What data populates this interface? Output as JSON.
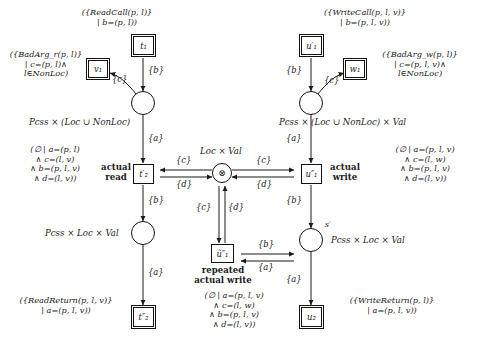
{
  "diagram": {
    "transitions": [
      {
        "id": "t1",
        "label": "t₁",
        "double": true
      },
      {
        "id": "v1",
        "label": "v₁",
        "double": true
      },
      {
        "id": "t2p",
        "label": "t′₂",
        "double": false
      },
      {
        "id": "t2pp",
        "label": "t″₂",
        "double": true
      },
      {
        "id": "u1p",
        "label": "u′₁",
        "double": true
      },
      {
        "id": "w1",
        "label": "w₁",
        "double": true
      },
      {
        "id": "u1pp",
        "label": "u″₁",
        "double": false
      },
      {
        "id": "u1tilde",
        "label": "ũ″₁",
        "double": false
      },
      {
        "id": "u2",
        "label": "u₂",
        "double": true
      }
    ],
    "places": [
      {
        "id": "p_read_in",
        "type_label": "Pcss × (Loc ∪ NonLoc)"
      },
      {
        "id": "p_read_out",
        "type_label": "Pcss × Loc × Val"
      },
      {
        "id": "p_write_in",
        "type_label": "Pcss × (Loc ∪ NonLoc) × Val"
      },
      {
        "id": "p_write_out",
        "type_label": "Pcss × Loc × Val",
        "marker": "s′"
      },
      {
        "id": "p_store",
        "type_label": "Loc × Val",
        "symbol": "⊗"
      }
    ],
    "labels": {
      "read_call": "({ReadCall(p, l)}\n| b=(p, l))",
      "bad_arg_r": "({BadArg_r(p, l)}\n| c=(p, l)∧\nl∈NonLoc)",
      "read_guard": "(∅ | a=(p, l)\n∧ c=(l, v)\n∧ b=(p, l, v)\n∧ d=(l, v))",
      "read_return": "({ReadReturn(p, l, v)}\n| a=(p, l, v))",
      "write_call": "({WriteCall(p, l, v)}\n| b=(p, l, v))",
      "bad_arg_w": "({BadArg_w(p, l)}\n| c=(p, l, v)∧\nl∈NonLoc)",
      "write_guard": "(∅ | a=(p, l, v)\n∧ c=(l, w)\n∧ b=(p, l, v)\n∧ d=(l, v))",
      "repeated_guard": "(∅ | a=(p, l, v)\n∧ c=(l, w)\n∧ b=(p, l, v)\n∧ d=(l, v))",
      "write_return": "({WriteReturn(p, l)}\n| a=(p, l, v))",
      "actual_read": "actual\nread",
      "actual_write": "actual\nwrite",
      "repeated_actual_write": "repeated\nactual write",
      "store_type": "Loc × Val",
      "read_in_type": "Pcss × (Loc ∪ NonLoc)",
      "read_out_type": "Pcss × Loc × Val",
      "write_in_type": "Pcss × (Loc ∪ NonLoc) × Val",
      "write_out_type": "Pcss × Loc × Val",
      "place_marker": "s′"
    },
    "arcs": [
      {
        "from": "t1",
        "to": "p_read_in",
        "label": "{b}"
      },
      {
        "from": "p_read_in",
        "to": "v1",
        "label": "{c}"
      },
      {
        "from": "p_read_in",
        "to": "t2p",
        "label": "{a}"
      },
      {
        "from": "p_store",
        "to": "t2p",
        "label": "{c}"
      },
      {
        "from": "t2p",
        "to": "p_store",
        "label": "{d}"
      },
      {
        "from": "t2p",
        "to": "p_read_out",
        "label": "{b}"
      },
      {
        "from": "p_read_out",
        "to": "t2pp",
        "label": "{a}"
      },
      {
        "from": "u1p",
        "to": "p_write_in",
        "label": "{b}"
      },
      {
        "from": "p_write_in",
        "to": "w1",
        "label": "{c}"
      },
      {
        "from": "p_write_in",
        "to": "u1pp",
        "label": "{a}"
      },
      {
        "from": "p_store",
        "to": "u1pp",
        "label": "{c}"
      },
      {
        "from": "u1pp",
        "to": "p_store",
        "label": "{d}"
      },
      {
        "from": "u1pp",
        "to": "p_write_out",
        "label": "{b}"
      },
      {
        "from": "p_store",
        "to": "u1tilde",
        "label": "{c}"
      },
      {
        "from": "u1tilde",
        "to": "p_store",
        "label": "{d}"
      },
      {
        "from": "u1tilde",
        "to": "p_write_out",
        "label": "{b}"
      },
      {
        "from": "p_write_out",
        "to": "u1tilde",
        "label": "{a}"
      },
      {
        "from": "p_write_out",
        "to": "u2",
        "label": "{a}"
      }
    ]
  },
  "colors": {
    "ink": "#1a1a1a",
    "paper": "#ffffff"
  }
}
